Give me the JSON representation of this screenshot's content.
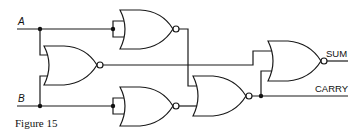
{
  "figure": {
    "caption": "Figure 15",
    "inputs": [
      {
        "id": "A",
        "label": "A"
      },
      {
        "id": "B",
        "label": "B"
      }
    ],
    "outputs": [
      {
        "id": "SUM",
        "label": "SUM"
      },
      {
        "id": "CARRY",
        "label": "CARRY"
      }
    ],
    "gates": [
      {
        "id": "g1",
        "type": "NOR",
        "inputs": [
          "A",
          "A"
        ]
      },
      {
        "id": "g2",
        "type": "NOR",
        "inputs": [
          "A",
          "B"
        ]
      },
      {
        "id": "g3",
        "type": "NOR",
        "inputs": [
          "B",
          "B"
        ]
      },
      {
        "id": "g4",
        "type": "NOR",
        "inputs": [
          "g1",
          "g3"
        ],
        "output": "CARRY"
      },
      {
        "id": "g5",
        "type": "NOR",
        "inputs": [
          "g2",
          "g4"
        ],
        "output": "SUM"
      }
    ],
    "colors": {
      "line": "#1a1a1a",
      "background": "#ffffff"
    }
  }
}
